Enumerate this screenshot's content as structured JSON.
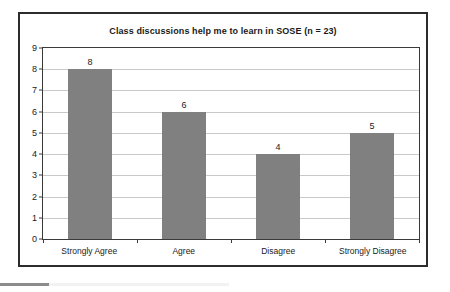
{
  "chart_data": {
    "type": "bar",
    "title": "Class discussions help me to learn in SOSE (n = 23)",
    "xlabel": "",
    "ylabel": "",
    "categories": [
      "Strongly Agree",
      "Agree",
      "Disagree",
      "Strongly Disagree"
    ],
    "values": [
      8,
      6,
      4,
      5
    ],
    "data_labels": [
      "8",
      "6",
      "4",
      "5"
    ],
    "ylim": [
      0,
      9
    ],
    "ytick_labels": [
      "9",
      "8",
      "7",
      "6",
      "5",
      "4",
      "3",
      "2",
      "1",
      "0"
    ],
    "ytick_values": [
      9,
      8,
      7,
      6,
      5,
      4,
      3,
      2,
      1,
      0
    ],
    "grid": true,
    "legend": false,
    "legend_position": "none",
    "series": [
      {
        "name": "Responses",
        "values": [
          8,
          6,
          4,
          5
        ]
      }
    ],
    "colors": {
      "bar": "#808080",
      "gridline": "#c9c9c9",
      "axis": "#3a3a3a",
      "frame": "#2c2c2c",
      "text": "#1a1a1a",
      "background": "#ffffff"
    }
  }
}
